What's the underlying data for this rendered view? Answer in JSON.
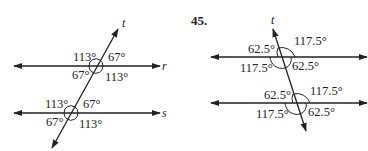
{
  "left_figure": {
    "transversal_label": "t",
    "line_labels": [
      "r",
      "s"
    ],
    "intersections": [
      {
        "line": "r",
        "angles": {
          "upper_left": "113°",
          "upper_right": "67°",
          "lower_left": "67°",
          "lower_right": "113°"
        }
      },
      {
        "line": "s",
        "angles": {
          "upper_left": "113°",
          "upper_right": "67°",
          "lower_left": "67°",
          "lower_right": "113°"
        }
      }
    ]
  },
  "right_figure": {
    "exercise_number": "45.",
    "transversal_label": "t",
    "intersections": [
      {
        "angles": {
          "upper_left": "62.5°",
          "upper_right": "117.5°",
          "lower_left": "117.5°",
          "lower_right": "62.5°"
        }
      },
      {
        "angles": {
          "upper_left": "62.5°",
          "upper_right": "117.5°",
          "lower_left": "117.5°",
          "lower_right": "62.5°"
        }
      }
    ]
  }
}
